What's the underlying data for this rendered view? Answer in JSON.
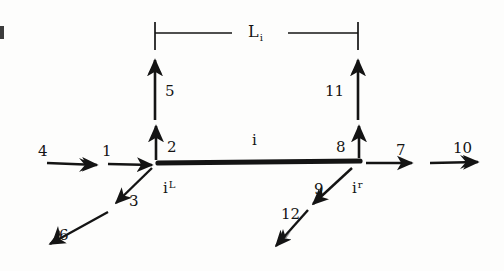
{
  "figure": {
    "name": "beam-element-force-diagram",
    "element_label": "i",
    "length_label": {
      "base": "L",
      "sub": "i"
    },
    "left_node": {
      "base": "i",
      "sup": "L"
    },
    "right_node": {
      "base": "i",
      "sup": "r"
    },
    "ink_color": "#141414",
    "background": "#fdfdfc"
  },
  "arrows": [
    {
      "id": "4",
      "label": "4",
      "direction": "right",
      "heads": 2
    },
    {
      "id": "1",
      "label": "1",
      "direction": "right",
      "heads": 1
    },
    {
      "id": "2",
      "label": "2",
      "direction": "up",
      "heads": 1
    },
    {
      "id": "5",
      "label": "5",
      "direction": "up",
      "heads": 2
    },
    {
      "id": "3",
      "label": "3",
      "direction": "down-left",
      "heads": 1
    },
    {
      "id": "6",
      "label": "6",
      "direction": "down-left",
      "heads": 2
    },
    {
      "id": "8",
      "label": "8",
      "direction": "up",
      "heads": 1
    },
    {
      "id": "11",
      "label": "11",
      "direction": "up",
      "heads": 2
    },
    {
      "id": "9",
      "label": "9",
      "direction": "down-left",
      "heads": 2
    },
    {
      "id": "12",
      "label": "12",
      "direction": "down-left",
      "heads": 2
    },
    {
      "id": "7",
      "label": "7",
      "direction": "right",
      "heads": 1
    },
    {
      "id": "10",
      "label": "10",
      "direction": "right",
      "heads": 2
    }
  ]
}
